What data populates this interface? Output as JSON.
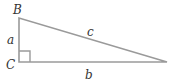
{
  "diagram": {
    "type": "right-triangle",
    "line_color": "#9a9a9a",
    "label_color": "#333333",
    "vertices": {
      "B": {
        "label": "B",
        "x": 19,
        "y": 18
      },
      "C": {
        "label": "C",
        "x": 19,
        "y": 62
      },
      "A": {
        "label": "",
        "x": 167,
        "y": 62
      }
    },
    "sides": {
      "a": {
        "label": "a",
        "between": [
          "B",
          "C"
        ]
      },
      "b": {
        "label": "b",
        "between": [
          "C",
          "A"
        ]
      },
      "c": {
        "label": "c",
        "between": [
          "B",
          "A"
        ]
      }
    },
    "right_angle_at": "C"
  }
}
